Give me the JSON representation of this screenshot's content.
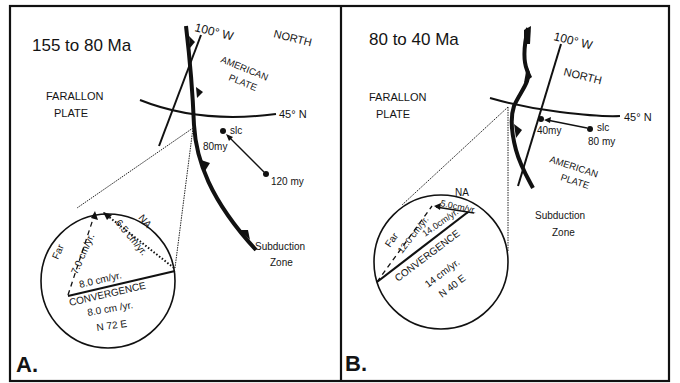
{
  "panels": [
    {
      "letter": "A.",
      "time_range": "155 to 80 Ma",
      "labels": {
        "meridian": "100° W",
        "north": "NORTH",
        "american_plate_1": "AMERICAN",
        "american_plate_2": "PLATE",
        "farallon_1": "FARALLON",
        "farallon_2": "PLATE",
        "parallel": "45° N",
        "slc": "slc",
        "age_near": "80my",
        "age_far": "120 my",
        "subduction_1": "Subduction",
        "subduction_2": "Zone"
      },
      "inset": {
        "far_label": "Far",
        "far_rate": "7.0 cm/yr.",
        "na_label": "NA",
        "na_rate": "6.5 cm/yr.",
        "conv_rate_top": "8.0 cm/yr.",
        "convergence": "CONVERGENCE",
        "conv_rate": "8.0 cm /yr.",
        "conv_direction": "N 72 E"
      }
    },
    {
      "letter": "B.",
      "time_range": "80 to 40 Ma",
      "labels": {
        "meridian": "100° W",
        "north": "NORTH",
        "american_plate_1": "AMERICAN",
        "american_plate_2": "PLATE",
        "farallon_1": "FARALLON",
        "farallon_2": "PLATE",
        "parallel": "45° N",
        "slc": "slc",
        "age_near": "40my",
        "age_far": "80 my",
        "subduction_1": "Subduction",
        "subduction_2": "Zone"
      },
      "inset": {
        "far_label": "Far",
        "far_rate": "12.0 cm/yr.",
        "na_label": "NA",
        "na_rate": "5.0cm/yr.",
        "conv_rate_top": "14.0cm/yr.",
        "convergence": "CONVERGENCE",
        "conv_rate": "14 cm/yr.",
        "conv_direction": "N 40 E"
      }
    }
  ]
}
